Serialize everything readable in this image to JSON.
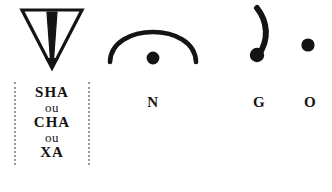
{
  "plate": {
    "name": "hieroglyph-sign-plate",
    "background_color": "#ffffff",
    "ink_color": "#141414",
    "bracket_color": "#9a9a9a"
  },
  "signs": [
    {
      "id": "sha",
      "icon": "inverted-triangle-with-wedge-icon",
      "readings": [
        {
          "text": "SHA",
          "emphasis": "major"
        },
        {
          "text": "ou",
          "emphasis": "minor"
        },
        {
          "text": "CHA",
          "emphasis": "major"
        },
        {
          "text": "ou",
          "emphasis": "minor"
        },
        {
          "text": "XA",
          "emphasis": "major"
        }
      ]
    },
    {
      "id": "n",
      "icon": "arch-with-dot-icon",
      "label": "N"
    },
    {
      "id": "g",
      "icon": "hook-stroke-with-blob-icon",
      "label": "G"
    },
    {
      "id": "o",
      "icon": "filled-dot-icon",
      "label": "O"
    }
  ]
}
